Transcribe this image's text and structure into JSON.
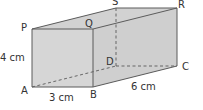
{
  "diagram": {
    "type": "rectangular-prism",
    "colors": {
      "fill": "#d6d6d6",
      "fill_side": "#cfcfcf",
      "fill_top": "#d2d2d2",
      "edge": "#5a5a5a",
      "hidden_edge": "#5a5a5a",
      "text": "#333333"
    },
    "vertices": {
      "P": {
        "label": "P",
        "x": 32,
        "y": 29
      },
      "Q": {
        "label": "Q",
        "x": 93,
        "y": 29
      },
      "R": {
        "label": "R",
        "x": 177,
        "y": 8
      },
      "S": {
        "label": "S",
        "x": 116,
        "y": 8
      },
      "A": {
        "label": "A",
        "x": 32,
        "y": 87
      },
      "B": {
        "label": "B",
        "x": 93,
        "y": 87
      },
      "C": {
        "label": "C",
        "x": 177,
        "y": 66
      },
      "D": {
        "label": "D",
        "x": 116,
        "y": 66
      }
    },
    "dimensions": {
      "height": "4 cm",
      "width": "3 cm",
      "length": "6 cm"
    }
  }
}
